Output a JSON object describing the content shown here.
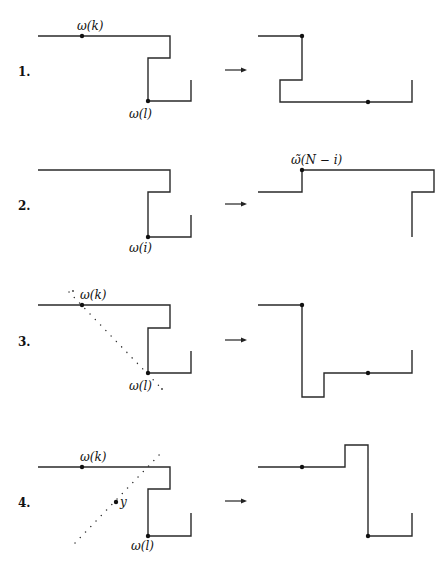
{
  "header": {
    "page_number": "",
    "running_title": ""
  },
  "figure": {
    "colors": {
      "line": "#2a2a2a",
      "background": "#ffffff"
    },
    "rows": [
      {
        "number": "1.",
        "left": {
          "labels": [
            {
              "text": "ω(k)",
              "x": 77,
              "y": 30
            },
            {
              "text": "ω(l)",
              "x": 129,
              "y": 118
            }
          ],
          "path": "38,36 170,36 170,58 148,58 148,101 191,101 191,80",
          "dots": [
            [
              82,
              36
            ],
            [
              148,
              101
            ]
          ],
          "dotted_lines": []
        },
        "right": {
          "labels": [],
          "path": "258,36 302,36 302,80 280,80 280,102 412,102 412,80",
          "dots": [
            [
              302,
              36
            ],
            [
              368,
              102
            ]
          ],
          "dotted_lines": []
        },
        "arrow_y": 70
      },
      {
        "number": "2.",
        "left": {
          "labels": [
            {
              "text": "ω(i)",
              "x": 129,
              "y": 252
            }
          ],
          "path": "38,170 170,170 170,192 148,192 148,237 191,237 191,215",
          "dots": [
            [
              148,
              237
            ]
          ],
          "dotted_lines": []
        },
        "right": {
          "labels": [
            {
              "text": "ω̃(N − i)",
              "x": 291,
              "y": 164
            }
          ],
          "path": "258,192 302,192 302,170 434,170 434,192 412,192 412,237",
          "dots": [
            [
              302,
              170
            ]
          ],
          "dotted_lines": []
        },
        "arrow_y": 204
      },
      {
        "number": "3.",
        "left": {
          "labels": [
            {
              "text": "ω(k)",
              "x": 80,
              "y": 299
            },
            {
              "text": "ω(l)",
              "x": 129,
              "y": 390
            }
          ],
          "path": "38,305 170,305 170,328 148,328 148,373 191,373 191,351",
          "dots": [
            [
              82,
              305
            ],
            [
              148,
              373
            ]
          ],
          "dotted_lines": [
            [
              69,
              292,
              162,
              389
            ]
          ],
          "extra_dots": [
            [
              73,
              291
            ],
            [
              162,
              389
            ]
          ]
        },
        "right": {
          "labels": [],
          "path": "258,305 302,305 302,397 324,397 324,373 412,373 412,350",
          "dots": [
            [
              302,
              305
            ],
            [
              368,
              373
            ]
          ],
          "dotted_lines": []
        },
        "arrow_y": 340
      },
      {
        "number": "4.",
        "left": {
          "labels": [
            {
              "text": "ω(k)",
              "x": 80,
              "y": 461
            },
            {
              "text": "ω(l)",
              "x": 131,
              "y": 550
            },
            {
              "text": "y",
              "x": 120,
              "y": 506
            }
          ],
          "path": "38,467 170,467 170,489 148,489 148,536 191,536 191,513",
          "dots": [
            [
              82,
              467
            ],
            [
              148,
              536
            ],
            [
              116,
              502
            ]
          ],
          "dotted_lines": [
            [
              75,
              543,
              162,
              452
            ]
          ]
        },
        "right": {
          "labels": [],
          "path": "258,467 345,467 345,445 368,445 368,536 412,536 412,513",
          "dots": [
            [
              302,
              467
            ],
            [
              368,
              536
            ]
          ],
          "dotted_lines": []
        },
        "arrow_y": 501
      }
    ]
  }
}
